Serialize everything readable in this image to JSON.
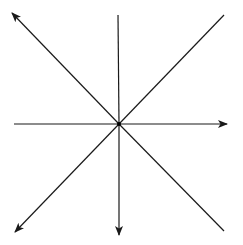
{
  "diagram": {
    "type": "radial-lines",
    "background": "#ffffff",
    "stroke_color": "#1a1a1a",
    "stroke_width": 1.2,
    "center": {
      "x": 119,
      "y": 124
    },
    "center_dot_radius": 2,
    "rays": [
      {
        "name": "ray-up-left",
        "x2": 12,
        "y2": 13,
        "arrow": true
      },
      {
        "name": "ray-up",
        "x2": 118,
        "y2": 15,
        "arrow": false
      },
      {
        "name": "ray-up-right",
        "x2": 224,
        "y2": 15,
        "arrow": false
      },
      {
        "name": "ray-right",
        "x2": 227,
        "y2": 124,
        "arrow": true
      },
      {
        "name": "ray-down-right",
        "x2": 224,
        "y2": 231,
        "arrow": false
      },
      {
        "name": "ray-down",
        "x2": 119,
        "y2": 235,
        "arrow": true
      },
      {
        "name": "ray-down-left",
        "x2": 15,
        "y2": 232,
        "arrow": true
      },
      {
        "name": "ray-left",
        "x2": 14,
        "y2": 124,
        "arrow": false
      }
    ]
  }
}
